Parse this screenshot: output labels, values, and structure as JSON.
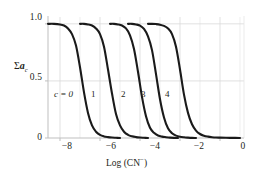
{
  "chart_data": {
    "type": "line",
    "title": "",
    "xlabel": "Log (CN⁻)",
    "ylabel": "Σa_c",
    "ylabel_parts": {
      "sigma": "Σ",
      "a": "a",
      "sub": "c"
    },
    "xlim": [
      -8.6,
      1.2
    ],
    "ylim": [
      0,
      1.06
    ],
    "xticks": [
      -8,
      -6,
      -4,
      -2,
      0
    ],
    "xtick_labels": [
      "−8",
      "−6",
      "−4",
      "−2",
      "0"
    ],
    "yticks": [
      0,
      0.5,
      1.0
    ],
    "ytick_labels": [
      "0",
      "0.5",
      "1.0"
    ],
    "grid": "both",
    "grid_color": "#d9d9d9",
    "axis_color": "#bfbfbf",
    "curve_color": "#1a1a1a",
    "legend_position": "inline-annotations",
    "series": [
      {
        "name": "c = 0",
        "label": "c = 0",
        "label_x": -7.6,
        "label_y": 0.38,
        "midpoint": -7.0,
        "slope": 3.1,
        "points_x": [
          -8.6,
          -8.3,
          -8.0,
          -7.8,
          -7.6,
          -7.4,
          -7.2,
          -7.0,
          -6.8,
          -6.6,
          -6.4,
          -6.2,
          -6.0,
          -5.8,
          -5.6,
          -5.4,
          -5.2,
          -5.0
        ],
        "points_y": [
          1.0,
          1.0,
          0.995,
          0.985,
          0.96,
          0.91,
          0.81,
          0.62,
          0.4,
          0.22,
          0.11,
          0.055,
          0.027,
          0.014,
          0.008,
          0.004,
          0.002,
          0.0
        ]
      },
      {
        "name": "c = 1",
        "label": "1",
        "label_x": -6.3,
        "label_y": 0.38,
        "midpoint": -5.6,
        "slope": 3.1,
        "points_x": [
          -7.0,
          -6.8,
          -6.6,
          -6.4,
          -6.2,
          -6.0,
          -5.8,
          -5.6,
          -5.4,
          -5.2,
          -5.0,
          -4.8,
          -4.6,
          -4.4,
          -4.2,
          -4.0,
          -3.8,
          -3.6
        ],
        "points_y": [
          1.0,
          1.0,
          0.995,
          0.985,
          0.96,
          0.91,
          0.8,
          0.6,
          0.39,
          0.21,
          0.11,
          0.055,
          0.028,
          0.015,
          0.008,
          0.004,
          0.002,
          0.0
        ]
      },
      {
        "name": "c = 2",
        "label": "2",
        "label_x": -4.8,
        "label_y": 0.38,
        "midpoint": -4.1,
        "slope": 3.4,
        "points_x": [
          -5.5,
          -5.3,
          -5.1,
          -4.9,
          -4.7,
          -4.5,
          -4.3,
          -4.1,
          -3.9,
          -3.7,
          -3.5,
          -3.3,
          -3.1,
          -2.9,
          -2.7,
          -2.5,
          -2.3,
          -2.1
        ],
        "points_y": [
          1.0,
          1.0,
          0.995,
          0.985,
          0.96,
          0.9,
          0.78,
          0.58,
          0.36,
          0.19,
          0.09,
          0.045,
          0.022,
          0.012,
          0.007,
          0.003,
          0.001,
          0.0
        ]
      },
      {
        "name": "c = 3",
        "label": "3",
        "label_x": -3.8,
        "label_y": 0.38,
        "midpoint": -3.2,
        "slope": 3.6,
        "points_x": [
          -4.6,
          -4.4,
          -4.2,
          -4.0,
          -3.8,
          -3.6,
          -3.4,
          -3.2,
          -3.0,
          -2.8,
          -2.6,
          -2.4,
          -2.2,
          -2.0,
          -1.8,
          -1.6,
          -1.4,
          -1.2
        ],
        "points_y": [
          1.0,
          1.0,
          0.995,
          0.985,
          0.955,
          0.89,
          0.77,
          0.56,
          0.34,
          0.18,
          0.085,
          0.042,
          0.021,
          0.011,
          0.006,
          0.003,
          0.001,
          0.0
        ]
      },
      {
        "name": "c = 4",
        "label": "4",
        "label_x": -2.6,
        "label_y": 0.38,
        "midpoint": -2.0,
        "slope": 3.2,
        "points_x": [
          -3.6,
          -3.4,
          -3.2,
          -3.0,
          -2.8,
          -2.6,
          -2.4,
          -2.2,
          -2.0,
          -1.8,
          -1.6,
          -1.4,
          -1.2,
          -1.0,
          -0.8,
          -0.6,
          -0.4,
          -0.2,
          0.0,
          0.3,
          0.7,
          1.0
        ],
        "points_y": [
          1.0,
          1.0,
          0.998,
          0.993,
          0.982,
          0.96,
          0.91,
          0.8,
          0.6,
          0.38,
          0.22,
          0.12,
          0.065,
          0.035,
          0.02,
          0.012,
          0.007,
          0.004,
          0.003,
          0.002,
          0.001,
          0.0
        ]
      }
    ]
  },
  "axes": {
    "y_tick_1": "1.0",
    "y_tick_2": "0.5",
    "y_tick_3": "0",
    "x_tick_1": "−8",
    "x_tick_2": "−6",
    "x_tick_3": "−4",
    "x_tick_4": "−2",
    "x_tick_5": "0",
    "x_axis_title_main": "Log (CN",
    "x_axis_title_sup": "−",
    "x_axis_title_close": ")"
  },
  "annotations": {
    "c0": "c = 0",
    "c1": "1",
    "c2": "2",
    "c3": "3",
    "c4": "4"
  }
}
